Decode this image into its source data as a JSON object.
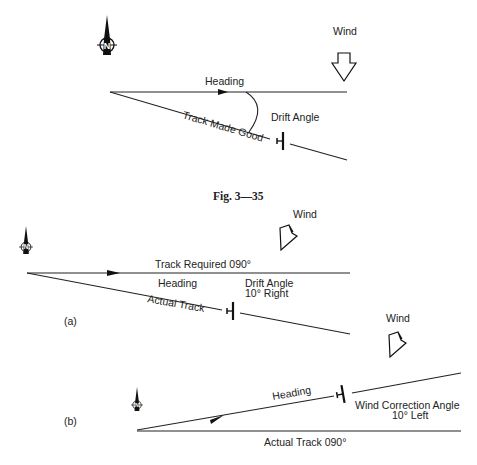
{
  "figure_caption": "Fig. 3—35",
  "top_diagram": {
    "wind_label": "Wind",
    "heading_label": "Heading",
    "drift_angle_label": "Drift Angle",
    "track_label": "Track Made Good"
  },
  "diagram_a": {
    "panel_label": "(a)",
    "wind_label": "Wind",
    "track_required_label": "Track Required 090°",
    "heading_label": "Heading",
    "drift_angle_label": "Drift Angle",
    "drift_angle_value": "10° Right",
    "actual_track_label": "Actual Track"
  },
  "diagram_b": {
    "panel_label": "(b)",
    "wind_label": "Wind",
    "heading_label": "Heading",
    "wca_label": "Wind Correction Angle",
    "wca_value": "10° Left",
    "actual_track_label": "Actual Track 090°"
  },
  "icons": [
    "north-compass-icon",
    "wind-arrow-icon",
    "aircraft-icon",
    "direction-arrowhead-icon"
  ]
}
